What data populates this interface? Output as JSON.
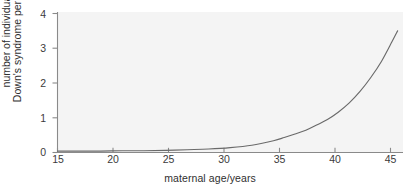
{
  "chart_data": {
    "type": "line",
    "title": "",
    "xlabel": "maternal age/years",
    "ylabel_line1": "number of individuals with",
    "ylabel_line2": "Down's syndrome per 100 births",
    "xlim": [
      15,
      47
    ],
    "ylim": [
      0,
      4.2
    ],
    "xticks": [
      15,
      20,
      25,
      30,
      35,
      40,
      45
    ],
    "yticks": [
      0,
      1,
      2,
      3,
      4
    ],
    "xtick_labels": [
      "15",
      "20",
      "25",
      "30",
      "35",
      "40",
      "45"
    ],
    "ytick_labels": [
      "0",
      "1",
      "2",
      "3",
      "4"
    ],
    "grid": false,
    "legend": null,
    "series": [
      {
        "name": "Down's syndrome incidence",
        "color": "#6a6a6a",
        "x": [
          15,
          17,
          19,
          21,
          23,
          25,
          27,
          29,
          31,
          33,
          35,
          36,
          37,
          38,
          39,
          40,
          41,
          42,
          43,
          44,
          45,
          46,
          46.5
        ],
        "y": [
          0.04,
          0.04,
          0.04,
          0.05,
          0.05,
          0.06,
          0.08,
          0.1,
          0.14,
          0.21,
          0.34,
          0.43,
          0.53,
          0.64,
          0.79,
          0.95,
          1.16,
          1.42,
          1.75,
          2.15,
          2.62,
          3.2,
          3.5
        ]
      }
    ],
    "plot_background": "#f4f4f4",
    "axis_color": "#8a8a8a",
    "text_color": "#2f2f2f"
  }
}
